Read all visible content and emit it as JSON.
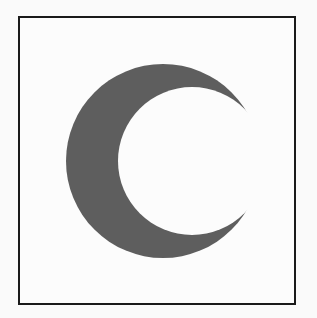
{
  "figure": {
    "symbol": "crescent-icon",
    "colors": {
      "crescent": "#5e5e5e",
      "background": "#fcfcfc",
      "border": "#1a1a1a"
    }
  }
}
